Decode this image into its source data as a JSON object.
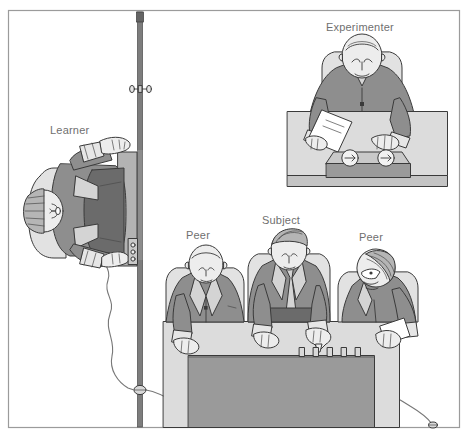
{
  "figure": {
    "domain": "Diagram",
    "width": 469,
    "height": 438,
    "border": {
      "name": "frame-border",
      "color": "#9b9b9b",
      "x": 8,
      "y": 10,
      "w": 452,
      "h": 418
    },
    "palette": {
      "background": "#ffffff",
      "outline": "#3a3a3a",
      "label_text": "#6f6f6f",
      "suit_mid": "#8e8e8e",
      "suit_dark": "#6e6e6e",
      "skin_light": "#ededed",
      "chair_light": "#e2e2e2",
      "desk_light": "#dcdcdc",
      "desk_shadow": "#b6b6b6",
      "console_front": "#9a9a9a",
      "partition_wall": "#7d7d7d",
      "hair_gray": "#b5b5b5",
      "wire": "#8a8a8a"
    },
    "labels": [
      {
        "id": "learner",
        "text": "Learner",
        "x": 50,
        "y": 124
      },
      {
        "id": "experimenter",
        "text": "Experimenter",
        "x": 326,
        "y": 21
      },
      {
        "id": "peer_left",
        "text": "Peer",
        "x": 186,
        "y": 229
      },
      {
        "id": "subject",
        "text": "Subject",
        "x": 262,
        "y": 214
      },
      {
        "id": "peer_right",
        "text": "Peer",
        "x": 359,
        "y": 231
      }
    ],
    "elements": {
      "partition_wall": {
        "name": "partition-wall",
        "description": "Vertical dividing wall separating the learner room from the shock-generator room",
        "x": 140,
        "y_top": 12,
        "y_bottom": 427
      },
      "door_handle": {
        "name": "door-handle",
        "description": "Overhead view of a door handle / latch on the partition wall",
        "x": 140,
        "y": 89
      },
      "wall_jack": {
        "name": "wall-wire-pass-through",
        "description": "Grommet where the shock wire passes through the partition wall",
        "x": 140,
        "y": 390
      },
      "learner_chair": {
        "name": "learner-chair",
        "description": "Learner seated, arms strapped down, electrode on wrist, viewed from above"
      },
      "learner_electrode": {
        "name": "learner-electrode",
        "description": "Electrode pad attached at the learner's hand"
      },
      "shock_wire": {
        "name": "shock-wire",
        "description": "Cable running from the learner's electrode, through the wall, to the shock generator"
      },
      "experimenter_desk": {
        "name": "experimenter-desk",
        "x": 287,
        "y": 112,
        "w": 160,
        "h": 76
      },
      "experimenter_paper": {
        "name": "experimenter-paper",
        "description": "Sheet of paper / answer list held on the desk"
      },
      "meter_box": {
        "name": "meter-box",
        "description": "Instrument box with two round gauges on the experimenter's desk",
        "gauge_count": 2
      },
      "shock_generator": {
        "name": "shock-generator-console",
        "description": "Long console in front of subject and peers",
        "x": 188,
        "y": 350,
        "w": 186,
        "h": 78
      },
      "shock_switches": {
        "name": "shock-generator-switches",
        "count": 5,
        "description": "Row of toggle switches on top of the shock generator console"
      },
      "table_front": {
        "name": "participants-table",
        "x": 163,
        "y": 322,
        "w": 236,
        "h": 106
      }
    },
    "people": [
      {
        "id": "learner",
        "name": "learner-figure",
        "role": "Learner",
        "posture": "seated, restrained, overhead view"
      },
      {
        "id": "experimenter",
        "name": "experimenter-figure",
        "role": "Experimenter",
        "posture": "leaning over desk"
      },
      {
        "id": "peer_left",
        "name": "peer-left-figure",
        "role": "Peer",
        "posture": "seated at console, bald"
      },
      {
        "id": "subject",
        "name": "subject-figure",
        "role": "Subject",
        "posture": "seated at console, pointing at switch"
      },
      {
        "id": "peer_right",
        "name": "peer-right-figure",
        "role": "Peer",
        "posture": "seated at console, turned in profile"
      }
    ]
  }
}
